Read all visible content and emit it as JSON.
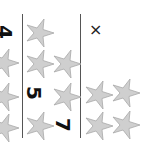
{
  "worksheet": {
    "digits": [
      "4",
      "5",
      "7"
    ],
    "mark": "×",
    "star_color": "#cfcfcf",
    "star_stroke": "#a8a8a8",
    "columns": [
      {
        "label": "4",
        "stars": 3
      },
      {
        "label": "5",
        "stars": 5
      },
      {
        "label": "7",
        "stars": 4
      }
    ]
  }
}
